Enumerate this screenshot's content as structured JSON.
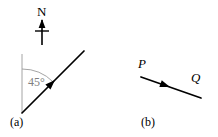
{
  "figure": {
    "background_color": "#ffffff",
    "stroke_color": "#000000",
    "guide_color": "#808080",
    "panels": [
      {
        "id": "a",
        "caption": "(a)",
        "caption_x": 10,
        "caption_y": 116,
        "north_indicator": {
          "label": "N",
          "label_x": 37,
          "label_y": 5,
          "icon": "north-arrow-icon",
          "shaft_x": 42,
          "shaft_top_y": 20,
          "shaft_bottom_y": 45,
          "crossbar_y": 31,
          "crossbar_half_width": 7
        },
        "reference_line": {
          "name": "vertical-reference-line",
          "x": 22,
          "y_top": 54,
          "y_bottom": 113,
          "color": "#9a9a9a"
        },
        "angle_arc": {
          "name": "angle-arc",
          "center_x": 22,
          "center_y": 113,
          "radius": 44,
          "start_angle_deg": 0,
          "end_angle_deg": 45,
          "color": "#9a9a9a"
        },
        "angle_label": {
          "text": "45°",
          "x": 28,
          "y": 76,
          "color": "#808080"
        },
        "bearing_vector": {
          "name": "bearing-vector",
          "x1": 22,
          "y1": 113,
          "x2": 84,
          "y2": 51,
          "arrow_at_x": 55,
          "arrow_at_y": 80,
          "color": "#000000"
        }
      },
      {
        "id": "b",
        "caption": "(b)",
        "caption_x": 141,
        "caption_y": 116,
        "start_label": {
          "text": "P",
          "x": 138,
          "y": 57
        },
        "end_label": {
          "text": "Q",
          "x": 191,
          "y": 71
        },
        "displacement_vector": {
          "name": "displacement-vector-pq",
          "x1": 141,
          "y1": 77,
          "x2": 201,
          "y2": 98,
          "arrow_at_x": 170,
          "arrow_at_y": 87,
          "color": "#000000"
        }
      }
    ]
  }
}
